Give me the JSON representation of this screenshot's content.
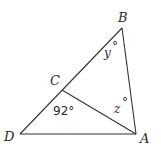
{
  "figure": {
    "type": "triangle-with-cevian",
    "points": {
      "A": {
        "label": "A",
        "x": 136,
        "y": 134
      },
      "B": {
        "label": "B",
        "x": 122,
        "y": 28
      },
      "C": {
        "label": "C",
        "x": 62,
        "y": 90
      },
      "D": {
        "label": "D",
        "x": 20,
        "y": 134
      }
    },
    "segments": [
      "DB",
      "BA",
      "DA",
      "CA"
    ],
    "angle_labels": {
      "angle_B": {
        "var": "y",
        "text": "y°"
      },
      "angle_DCA": {
        "text": "92°"
      },
      "angle_BAC": {
        "var": "z",
        "text": "z°"
      }
    }
  },
  "labels": {
    "A": "A",
    "B": "B",
    "C": "C",
    "D": "D",
    "y_num": "y",
    "z_num": "z",
    "deg": "°",
    "angle_92": "92°"
  }
}
